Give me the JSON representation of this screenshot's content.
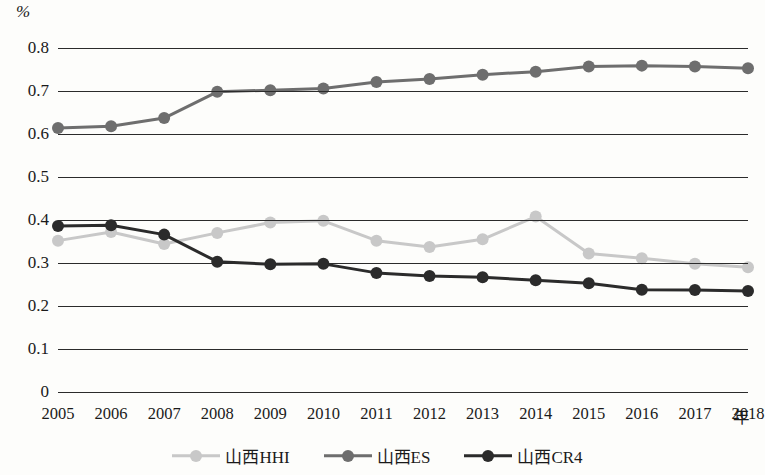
{
  "axis": {
    "y_unit": "%",
    "y_ticks": [
      "0.8",
      "0.7",
      "0.6",
      "0.5",
      "0.4",
      "0.3",
      "0.2",
      "0.1",
      "0"
    ],
    "x_unit": "年"
  },
  "legend": {
    "items": [
      {
        "label": "山西HHI",
        "color": "#c8c8c8"
      },
      {
        "label": "山西ES",
        "color": "#6e6e6e"
      },
      {
        "label": "山西CR4",
        "color": "#2b2b2b"
      }
    ]
  },
  "chart_data": {
    "type": "line",
    "title": "",
    "xlabel": "年",
    "ylabel": "%",
    "ylim": [
      0,
      0.8
    ],
    "ytick_values": [
      0.8,
      0.7,
      0.6,
      0.5,
      0.4,
      0.3,
      0.2,
      0.1,
      0
    ],
    "grid": true,
    "legend_position": "bottom",
    "categories": [
      "2005",
      "2006",
      "2007",
      "2008",
      "2009",
      "2010",
      "2011",
      "2012",
      "2013",
      "2014",
      "2015",
      "2016",
      "2017",
      "2018"
    ],
    "series": [
      {
        "name": "山西HHI",
        "color": "#c8c8c8",
        "values": [
          0.352,
          0.372,
          0.344,
          0.37,
          0.394,
          0.398,
          0.352,
          0.337,
          0.355,
          0.408,
          0.322,
          0.311,
          0.298,
          0.29
        ]
      },
      {
        "name": "山西ES",
        "color": "#6e6e6e",
        "values": [
          0.614,
          0.618,
          0.637,
          0.698,
          0.702,
          0.706,
          0.721,
          0.728,
          0.738,
          0.745,
          0.757,
          0.759,
          0.757,
          0.753
        ]
      },
      {
        "name": "山西CR4",
        "color": "#2b2b2b",
        "values": [
          0.386,
          0.388,
          0.366,
          0.303,
          0.297,
          0.298,
          0.277,
          0.27,
          0.267,
          0.26,
          0.253,
          0.238,
          0.237,
          0.235
        ]
      }
    ]
  }
}
